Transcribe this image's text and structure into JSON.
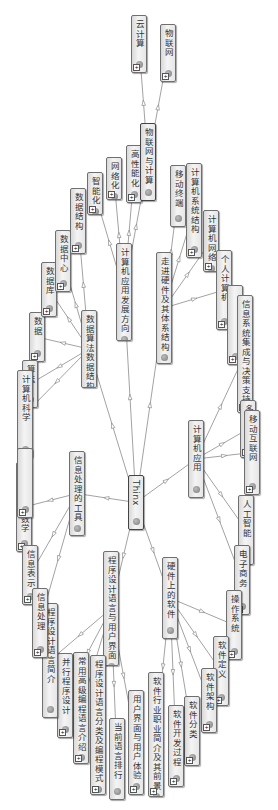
{
  "diagram": {
    "type": "mind-map",
    "orientation": "rotated-90-clockwise",
    "root": "Thinx",
    "nodes": [
      {
        "id": "root",
        "label": "Thinx",
        "x": 128,
        "y": 475,
        "w": 16,
        "h": 55,
        "bold": true,
        "plus": false
      },
      {
        "id": "b1",
        "label": "计算机应用发展方向",
        "x": 116,
        "y": 243,
        "w": 16,
        "h": 98,
        "plus": false
      },
      {
        "id": "b1c1",
        "label": "智能化",
        "x": 87,
        "y": 172,
        "w": 16,
        "h": 43,
        "plus": true
      },
      {
        "id": "b1c2",
        "label": "网络化",
        "x": 106,
        "y": 157,
        "w": 16,
        "h": 43,
        "plus": true
      },
      {
        "id": "b1c3",
        "label": "高性能化",
        "x": 126,
        "y": 145,
        "w": 16,
        "h": 58,
        "plus": true
      },
      {
        "id": "b1c4",
        "label": "物联网与计算",
        "x": 140,
        "y": 123,
        "w": 16,
        "h": 78,
        "bold": true,
        "plus": false
      },
      {
        "id": "b1c4a",
        "label": "云计算",
        "x": 131,
        "y": 15,
        "w": 16,
        "h": 58,
        "plus": true
      },
      {
        "id": "b1c4b",
        "label": "物联网",
        "x": 160,
        "y": 24,
        "w": 16,
        "h": 58,
        "plus": true
      },
      {
        "id": "b2",
        "label": "数据算法数据结构",
        "x": 81,
        "y": 310,
        "w": 16,
        "h": 78,
        "plus": false
      },
      {
        "id": "b2c1",
        "label": "数据",
        "x": 29,
        "y": 312,
        "w": 16,
        "h": 50,
        "plus": true
      },
      {
        "id": "b2c2",
        "label": "数据库",
        "x": 41,
        "y": 262,
        "w": 16,
        "h": 55,
        "plus": true
      },
      {
        "id": "b2c3",
        "label": "数据中心",
        "x": 55,
        "y": 230,
        "w": 16,
        "h": 62,
        "plus": true
      },
      {
        "id": "b2c4",
        "label": "数据结构",
        "x": 70,
        "y": 188,
        "w": 16,
        "h": 66,
        "plus": true
      },
      {
        "id": "b2c5",
        "label": "算法",
        "x": 22,
        "y": 360,
        "w": 16,
        "h": 48,
        "plus": true
      },
      {
        "id": "b2c6",
        "label": "计算机科学",
        "x": 17,
        "y": 370,
        "w": 16,
        "h": 88,
        "plus": true
      },
      {
        "id": "b3",
        "label": "走进硬件及其体系结构",
        "x": 156,
        "y": 252,
        "w": 16,
        "h": 112,
        "plus": false
      },
      {
        "id": "b3c1",
        "label": "移动终端",
        "x": 170,
        "y": 165,
        "w": 16,
        "h": 62,
        "plus": false
      },
      {
        "id": "b3c2",
        "label": "计算机系统结构",
        "x": 186,
        "y": 163,
        "w": 16,
        "h": 95,
        "plus": true
      },
      {
        "id": "b3c3",
        "label": "计算机网络",
        "x": 203,
        "y": 210,
        "w": 16,
        "h": 62,
        "plus": true
      },
      {
        "id": "b3c4",
        "label": "个人计算机",
        "x": 216,
        "y": 250,
        "w": 16,
        "h": 80,
        "plus": true
      },
      {
        "id": "b4",
        "label": "计算机应用",
        "x": 188,
        "y": 420,
        "w": 16,
        "h": 78,
        "plus": false
      },
      {
        "id": "b4c0",
        "label": "",
        "x": 227,
        "y": 285,
        "w": 16,
        "h": 80,
        "plus": true
      },
      {
        "id": "b4c1",
        "label": "信息系统集成与决策支持",
        "x": 237,
        "y": 295,
        "w": 16,
        "h": 118,
        "plus": true
      },
      {
        "id": "b4c2",
        "label": "多媒体",
        "x": 240,
        "y": 400,
        "w": 16,
        "h": 58,
        "plus": true
      },
      {
        "id": "b4c3",
        "label": "移动互联网",
        "x": 244,
        "y": 410,
        "w": 16,
        "h": 85,
        "plus": true
      },
      {
        "id": "b4c4",
        "label": "人工智能",
        "x": 238,
        "y": 495,
        "w": 16,
        "h": 70,
        "plus": true
      },
      {
        "id": "b4c5",
        "label": "电子商务",
        "x": 234,
        "y": 545,
        "w": 16,
        "h": 70,
        "plus": true
      },
      {
        "id": "b5",
        "label": "硬件上的软件",
        "x": 162,
        "y": 557,
        "w": 16,
        "h": 82,
        "plus": false
      },
      {
        "id": "b5c1",
        "label": "操作系统",
        "x": 226,
        "y": 590,
        "w": 16,
        "h": 70,
        "plus": true
      },
      {
        "id": "b5c2",
        "label": "软件定义",
        "x": 213,
        "y": 636,
        "w": 16,
        "h": 70,
        "plus": true
      },
      {
        "id": "b5c3",
        "label": "软件架构",
        "x": 201,
        "y": 668,
        "w": 16,
        "h": 65,
        "plus": true
      },
      {
        "id": "b5c4",
        "label": "软件分类",
        "x": 184,
        "y": 696,
        "w": 16,
        "h": 70,
        "plus": true
      },
      {
        "id": "b5c5",
        "label": "软件开发过程",
        "x": 168,
        "y": 705,
        "w": 16,
        "h": 82,
        "plus": true
      },
      {
        "id": "b5c6",
        "label": "软件行业职业简介及其前景",
        "x": 148,
        "y": 672,
        "w": 16,
        "h": 125,
        "plus": true
      },
      {
        "id": "b6",
        "label": "程序设计语言与用户界面",
        "x": 103,
        "y": 551,
        "w": 16,
        "h": 115,
        "plus": false
      },
      {
        "id": "b6c1",
        "label": "用户界面与用户体验",
        "x": 128,
        "y": 690,
        "w": 16,
        "h": 105,
        "plus": true
      },
      {
        "id": "b6c2",
        "label": "当前语言排行",
        "x": 109,
        "y": 718,
        "w": 16,
        "h": 82,
        "plus": false
      },
      {
        "id": "b6c3",
        "label": "程序设计语言分类及编程模式",
        "x": 90,
        "y": 655,
        "w": 16,
        "h": 140,
        "plus": true
      },
      {
        "id": "b6c4",
        "label": "常用高级编程语言介绍",
        "x": 73,
        "y": 652,
        "w": 16,
        "h": 112,
        "plus": true
      },
      {
        "id": "b6c5",
        "label": "并行程序设计",
        "x": 57,
        "y": 653,
        "w": 16,
        "h": 85,
        "plus": true
      },
      {
        "id": "b6c6",
        "label": "程序设计语言简介",
        "x": 42,
        "y": 603,
        "w": 16,
        "h": 115,
        "plus": false
      },
      {
        "id": "b7",
        "label": "信息处理的工具",
        "x": 69,
        "y": 451,
        "w": 16,
        "h": 85,
        "plus": false
      },
      {
        "id": "b7c1",
        "label": "信息处理与数学",
        "x": 16,
        "y": 462,
        "w": 16,
        "h": 90,
        "plus": true
      },
      {
        "id": "b7c2",
        "label": "信息表示",
        "x": 22,
        "y": 545,
        "w": 16,
        "h": 60,
        "plus": true
      },
      {
        "id": "b7c3",
        "label": "信息处理",
        "x": 32,
        "y": 588,
        "w": 16,
        "h": 70,
        "plus": true
      },
      {
        "id": "b7c4",
        "label": "",
        "x": 17,
        "y": 448,
        "w": 16,
        "h": 70,
        "plus": true
      }
    ],
    "edges": [
      [
        "root",
        "b1"
      ],
      [
        "root",
        "b2"
      ],
      [
        "root",
        "b3"
      ],
      [
        "root",
        "b4"
      ],
      [
        "root",
        "b5"
      ],
      [
        "root",
        "b6"
      ],
      [
        "root",
        "b7"
      ],
      [
        "b1",
        "b1c1"
      ],
      [
        "b1",
        "b1c2"
      ],
      [
        "b1",
        "b1c3"
      ],
      [
        "b1",
        "b1c4"
      ],
      [
        "b1c4",
        "b1c4a"
      ],
      [
        "b1c4",
        "b1c4b"
      ],
      [
        "b2",
        "b2c1"
      ],
      [
        "b2",
        "b2c2"
      ],
      [
        "b2",
        "b2c3"
      ],
      [
        "b2",
        "b2c4"
      ],
      [
        "b2",
        "b2c5"
      ],
      [
        "b2",
        "b2c6"
      ],
      [
        "b3",
        "b3c1"
      ],
      [
        "b3",
        "b3c2"
      ],
      [
        "b3",
        "b3c3"
      ],
      [
        "b3",
        "b3c4"
      ],
      [
        "b4",
        "b4c1"
      ],
      [
        "b4",
        "b4c2"
      ],
      [
        "b4",
        "b4c3"
      ],
      [
        "b4",
        "b4c4"
      ],
      [
        "b4",
        "b4c5"
      ],
      [
        "b5",
        "b5c1"
      ],
      [
        "b5",
        "b5c2"
      ],
      [
        "b5",
        "b5c3"
      ],
      [
        "b5",
        "b5c4"
      ],
      [
        "b5",
        "b5c5"
      ],
      [
        "b5",
        "b5c6"
      ],
      [
        "b6",
        "b6c1"
      ],
      [
        "b6",
        "b6c2"
      ],
      [
        "b6",
        "b6c3"
      ],
      [
        "b6",
        "b6c4"
      ],
      [
        "b6",
        "b6c5"
      ],
      [
        "b6",
        "b6c6"
      ],
      [
        "b7",
        "b7c1"
      ],
      [
        "b7",
        "b7c2"
      ],
      [
        "b7",
        "b7c3"
      ]
    ]
  }
}
